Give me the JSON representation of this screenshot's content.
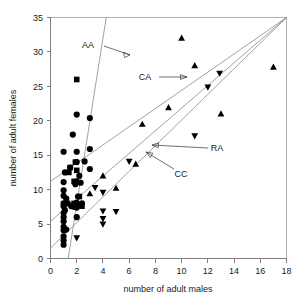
{
  "chart_data": {
    "type": "scatter",
    "title": "",
    "xlabel": "number of adult males",
    "ylabel": "number of adult females",
    "xlim": [
      0,
      18
    ],
    "ylim": [
      0,
      35
    ],
    "xticks": [
      0,
      2,
      4,
      6,
      8,
      10,
      12,
      14,
      16,
      18
    ],
    "yticks": [
      0,
      5,
      10,
      15,
      20,
      25,
      30,
      35
    ],
    "grid": false,
    "legend_position": "inline-annotations",
    "series": [
      {
        "name": "circle",
        "marker": "circle",
        "points": [
          [
            2,
            20.9
          ],
          [
            3,
            20.4
          ],
          [
            1.7,
            18.0
          ],
          [
            1,
            15.5
          ],
          [
            2,
            15.5
          ],
          [
            3,
            15.9
          ],
          [
            2,
            14.0
          ],
          [
            2.6,
            14.1
          ],
          [
            3,
            13.0
          ],
          [
            1.1,
            12.5
          ],
          [
            1,
            11.1
          ],
          [
            2,
            11.2
          ],
          [
            2.3,
            11.0
          ],
          [
            1,
            9.9
          ],
          [
            1,
            9.1
          ],
          [
            1.2,
            8.7
          ],
          [
            2,
            8.1
          ],
          [
            2.4,
            8.0
          ],
          [
            1,
            8.0
          ],
          [
            1,
            7.6
          ],
          [
            1.1,
            7.0
          ],
          [
            1.6,
            7.6
          ],
          [
            1.8,
            7.5
          ],
          [
            2,
            7.4
          ],
          [
            1,
            6.6
          ],
          [
            1,
            6.0
          ],
          [
            2,
            6.0
          ],
          [
            1,
            5.4
          ],
          [
            1,
            4.6
          ],
          [
            1.2,
            4.2
          ],
          [
            1,
            4.1
          ],
          [
            1,
            3.2
          ],
          [
            1,
            2.6
          ],
          [
            1,
            2.0
          ],
          [
            2.1,
            9.0
          ],
          [
            1.9,
            10.8
          ],
          [
            2.2,
            12.0
          ],
          [
            1.5,
            13.2
          ]
        ]
      },
      {
        "name": "square",
        "marker": "square",
        "points": [
          [
            2,
            26.0
          ],
          [
            1.5,
            13.2
          ],
          [
            1.4,
            12.5
          ],
          [
            1.8,
            11.2
          ],
          [
            1.9,
            14.0
          ],
          [
            2,
            12.8
          ],
          [
            1.3,
            8.0
          ],
          [
            1.6,
            7.7
          ],
          [
            2,
            7.8
          ],
          [
            2.4,
            7.6
          ],
          [
            1.8,
            8.0
          ],
          [
            2.2,
            9.0
          ]
        ]
      },
      {
        "name": "triangle-up",
        "marker": "triangle-up",
        "points": [
          [
            10,
            32.0
          ],
          [
            11,
            28.0
          ],
          [
            17,
            27.8
          ],
          [
            9,
            21.9
          ],
          [
            13,
            21.0
          ],
          [
            7,
            19.5
          ],
          [
            4,
            12.0
          ],
          [
            3,
            9.4
          ],
          [
            6.5,
            13.7
          ],
          [
            5,
            10.2
          ]
        ]
      },
      {
        "name": "triangle-down",
        "marker": "triangle-down",
        "points": [
          [
            12.9,
            26.9
          ],
          [
            12,
            24.9
          ],
          [
            11,
            17.8
          ],
          [
            6,
            14.1
          ],
          [
            3.4,
            10.3
          ],
          [
            4,
            9.6
          ],
          [
            4,
            6.9
          ],
          [
            5,
            6.8
          ],
          [
            4,
            5.8
          ],
          [
            4,
            5.0
          ],
          [
            2,
            3.0
          ]
        ]
      }
    ],
    "fit_lines": [
      {
        "name": "AA",
        "x1": 1.35,
        "y1": 0,
        "x2": 4.25,
        "y2": 35
      },
      {
        "name": "CA",
        "x1": 0,
        "y1": 11.2,
        "x2": 18,
        "y2": 35
      },
      {
        "name": "RA",
        "x1": 0,
        "y1": 5.4,
        "x2": 18,
        "y2": 35
      },
      {
        "name": "CC",
        "x1": 0,
        "y1": 1.5,
        "x2": 18,
        "y2": 35
      }
    ],
    "annotations": [
      {
        "label": "AA",
        "text_x": 88,
        "text_y": 48
      },
      {
        "label": "CA",
        "text_x": 143,
        "text_y": 80
      },
      {
        "label": "RA",
        "text_x": 213,
        "text_y": 151
      },
      {
        "label": "CC",
        "text_x": 177,
        "text_y": 176
      }
    ]
  },
  "axes": {
    "x_title": "number of adult males",
    "y_title": "number of adult females",
    "x_tick_labels": [
      "0",
      "2",
      "4",
      "6",
      "8",
      "10",
      "12",
      "14",
      "16",
      "18"
    ],
    "y_tick_labels": [
      "0",
      "5",
      "10",
      "15",
      "20",
      "25",
      "30",
      "35"
    ]
  },
  "labels": {
    "aa": "AA",
    "ca": "CA",
    "ra": "RA",
    "cc": "CC"
  },
  "colors": {
    "marker": "#000000",
    "fit_line": "#8a8a8a",
    "axis": "#808080",
    "text": "#1a1a1a",
    "background": "#ffffff"
  }
}
